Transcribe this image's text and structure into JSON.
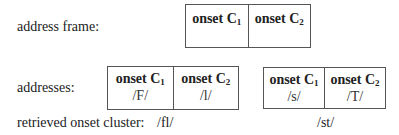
{
  "labels": {
    "address_frame": "address frame:",
    "addresses": "addresses:",
    "retrieved": "retrieved onset cluster:"
  },
  "frame": {
    "cells": [
      {
        "head": "onset C",
        "sub": "1"
      },
      {
        "head": "onset C",
        "sub": "2"
      }
    ]
  },
  "address_boxes": [
    {
      "cells": [
        {
          "head": "onset C",
          "sub": "1",
          "value": "/F/"
        },
        {
          "head": "onset C",
          "sub": "2",
          "value": "/l/"
        }
      ],
      "retrieved": "/fl/"
    },
    {
      "cells": [
        {
          "head": "onset C",
          "sub": "1",
          "value": "/s/"
        },
        {
          "head": "onset C",
          "sub": "2",
          "value": "/T/"
        }
      ],
      "retrieved": "/st/"
    }
  ]
}
